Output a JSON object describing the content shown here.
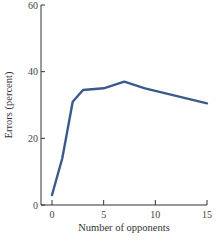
{
  "chart_data": {
    "type": "line",
    "title": "",
    "xlabel": "Number of opponents",
    "ylabel": "Errors (percent)",
    "xlim": [
      0,
      15
    ],
    "ylim": [
      0,
      60
    ],
    "xticks": [
      0,
      5,
      10,
      15
    ],
    "yticks": [
      0,
      20,
      40,
      60
    ],
    "grid": false,
    "legend": null,
    "series": [
      {
        "name": "Errors",
        "color": "#3a5a8c",
        "x": [
          0,
          1,
          2,
          3,
          5,
          7,
          9,
          15
        ],
        "y": [
          3,
          14,
          31,
          34.5,
          35,
          37,
          35,
          30.5
        ]
      }
    ]
  },
  "labels": {
    "xlabel": "Number of opponents",
    "ylabel": "Errors (percent)",
    "xticks": [
      "0",
      "5",
      "10",
      "15"
    ],
    "yticks": [
      "0",
      "20",
      "40",
      "60"
    ]
  }
}
